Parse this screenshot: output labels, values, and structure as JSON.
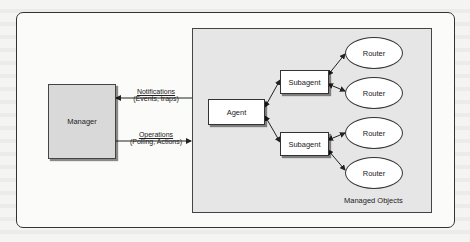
{
  "diagram": {
    "manager": {
      "label": "Manager"
    },
    "agent": {
      "label": "Agent"
    },
    "subagents": [
      {
        "label": "Subagent"
      },
      {
        "label": "Subagent"
      }
    ],
    "routers": [
      {
        "label": "Router"
      },
      {
        "label": "Router"
      },
      {
        "label": "Router"
      },
      {
        "label": "Router"
      }
    ],
    "managed_objects": {
      "label": "Managed Objects"
    },
    "edges": {
      "notifications": {
        "title": "Notifications",
        "subtitle": "(Events, traps)"
      },
      "operations": {
        "title": "Operations",
        "subtitle": "(Polling, Actions)"
      }
    },
    "colors": {
      "manager_fill": "#d9d9d9",
      "managed_area_fill": "#e6e6e6",
      "node_fill": "#ffffff",
      "stroke": "#333333"
    }
  }
}
